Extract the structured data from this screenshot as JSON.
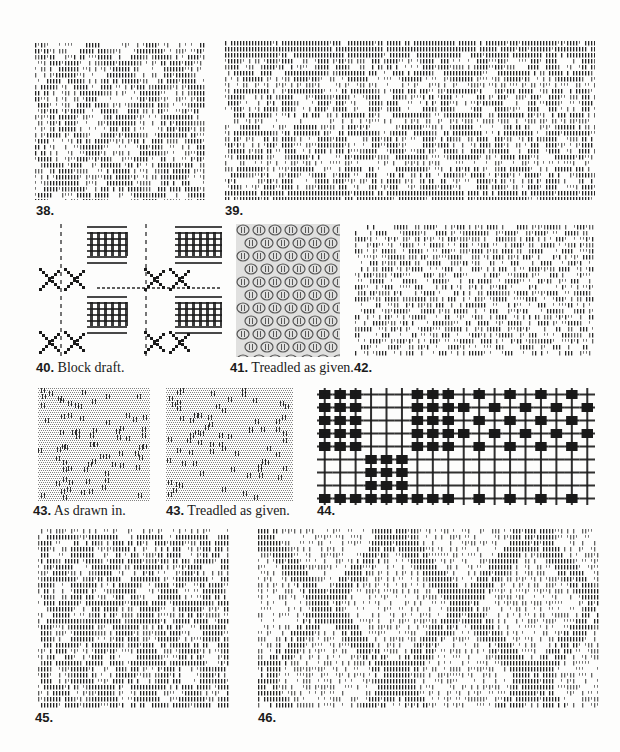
{
  "page": {
    "background": "#fdfdfc",
    "ink": "#1a1a1a"
  },
  "figures": [
    {
      "id": "38",
      "number": "38.",
      "caption": "",
      "box": [
        35,
        42,
        170,
        158
      ],
      "style": "overshot-dashes",
      "motif": "diamond-table"
    },
    {
      "id": "39",
      "number": "39.",
      "caption": "",
      "box": [
        225,
        40,
        370,
        160
      ],
      "style": "overshot-dashes",
      "motif": "wheels-and-ovals"
    },
    {
      "id": "40",
      "number": "40.",
      "caption": "Block draft.",
      "box": [
        35,
        224,
        187,
        133
      ],
      "style": "block-draft",
      "motif": "blocks-and-crosses"
    },
    {
      "id": "41",
      "number": "41.",
      "caption": "Treadled as given.",
      "box": [
        236,
        224,
        104,
        133
      ],
      "style": "fine-lace",
      "motif": "small-ovals"
    },
    {
      "id": "42",
      "number": "42.",
      "caption": "",
      "box": [
        355,
        224,
        240,
        133
      ],
      "style": "overshot-dashes",
      "motif": "x-diamond"
    },
    {
      "id": "43a",
      "number": "43.",
      "caption": "As drawn in.",
      "box": [
        38,
        388,
        112,
        114
      ],
      "style": "grey-texture",
      "motif": "scattered-dots"
    },
    {
      "id": "43b",
      "number": "43.",
      "caption": "Treadled as given.",
      "box": [
        166,
        388,
        127,
        114
      ],
      "style": "grey-texture",
      "motif": "scattered-dots"
    },
    {
      "id": "44",
      "number": "44.",
      "caption": "",
      "box": [
        317,
        388,
        278,
        117
      ],
      "style": "solid-checker",
      "motif": "block-checker"
    },
    {
      "id": "45",
      "number": "45.",
      "caption": "",
      "box": [
        38,
        528,
        192,
        180
      ],
      "style": "overshot-dashes",
      "motif": "circles"
    },
    {
      "id": "46",
      "number": "46.",
      "caption": "",
      "box": [
        258,
        528,
        342,
        180
      ],
      "style": "overshot-dashes",
      "motif": "star-and-diamond"
    }
  ],
  "captions": {
    "c38": {
      "num": "38.",
      "text": ""
    },
    "c39": {
      "num": "39.",
      "text": ""
    },
    "c40": {
      "num": "40.",
      "text": " Block draft."
    },
    "c41": {
      "num": "41.",
      "text": " Treadled as given."
    },
    "c42": {
      "num": "42.",
      "text": ""
    },
    "c43a": {
      "num": "43.",
      "text": " As drawn in."
    },
    "c43b": {
      "num": "43.",
      "text": " Treadled as given."
    },
    "c44": {
      "num": "44.",
      "text": ""
    },
    "c45": {
      "num": "45.",
      "text": ""
    },
    "c46": {
      "num": "46.",
      "text": ""
    }
  }
}
